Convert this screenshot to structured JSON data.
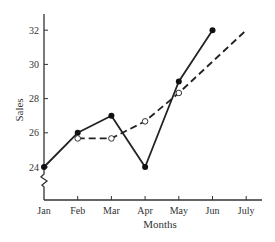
{
  "chart_data": {
    "type": "line",
    "title": "",
    "xlabel": "Months",
    "ylabel": "Sales",
    "categories": [
      "Jan",
      "Feb",
      "Mar",
      "Apr",
      "May",
      "Jun",
      "July"
    ],
    "y_ticks": [
      24,
      26,
      28,
      30,
      32
    ],
    "ylim": [
      22.5,
      33
    ],
    "y_axis_break": true,
    "grid": false,
    "legend": "none",
    "series": [
      {
        "name": "Sales",
        "style": "solid",
        "marker": "filled-circle",
        "values": [
          24,
          26,
          27,
          24,
          29,
          32,
          null
        ]
      },
      {
        "name": "Moving average",
        "style": "dashed",
        "marker": "open-circle",
        "values": [
          null,
          25.67,
          25.67,
          26.67,
          28.33,
          null,
          null
        ],
        "trend_extension": {
          "from": "May",
          "to": "July",
          "end_value": 32
        }
      }
    ]
  }
}
